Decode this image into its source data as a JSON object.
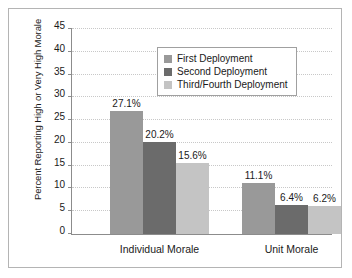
{
  "chart_data": {
    "type": "bar",
    "title": "",
    "subtitle": "",
    "xlabel": "",
    "ylabel": "Percent Reporting High or Very High Morale",
    "categories": [
      "Individual Morale",
      "Unit Morale"
    ],
    "series": [
      {
        "name": "First Deployment",
        "color": "#999999",
        "values": [
          27.1,
          6.4
        ],
        "labels": [
          "27.1%",
          "11.1%"
        ]
      },
      {
        "name": "Second Deployment",
        "color": "#6b6b6b",
        "values": [
          20.2,
          6.4
        ],
        "labels": [
          "20.2%",
          "6.4%"
        ]
      },
      {
        "name": "Third/Fourth Deployment",
        "color": "#c4c4c4",
        "values": [
          15.6,
          6.2
        ],
        "labels": [
          "15.6%",
          "6.2%"
        ]
      }
    ],
    "values_by_category": {
      "Individual Morale": [
        27.1,
        20.2,
        15.6
      ],
      "Unit Morale": [
        11.1,
        6.4,
        6.2
      ]
    },
    "ylim": [
      0,
      45
    ],
    "ytick_step": 5,
    "yticks": [
      0,
      5,
      10,
      15,
      20,
      25,
      30,
      35,
      40,
      45
    ],
    "ytick_labels": [
      "0",
      "5",
      "10",
      "15",
      "20",
      "25",
      "30",
      "35",
      "40",
      "45"
    ],
    "grid": true,
    "grid_style": "dotted",
    "legend_position": "top-center",
    "value_labels_shown": true,
    "colors": {
      "series_1": "#999999",
      "series_2": "#6b6b6b",
      "series_3": "#c4c4c4",
      "axis": "#8c8c8c",
      "grid": "#c8c8c8",
      "text": "#1a1a1a",
      "border": "#b4b4b4",
      "background": "#ffffff"
    }
  },
  "legend": {
    "items": [
      {
        "label": "First Deployment"
      },
      {
        "label": "Second Deployment"
      },
      {
        "label": "Third/Fourth Deployment"
      }
    ]
  }
}
